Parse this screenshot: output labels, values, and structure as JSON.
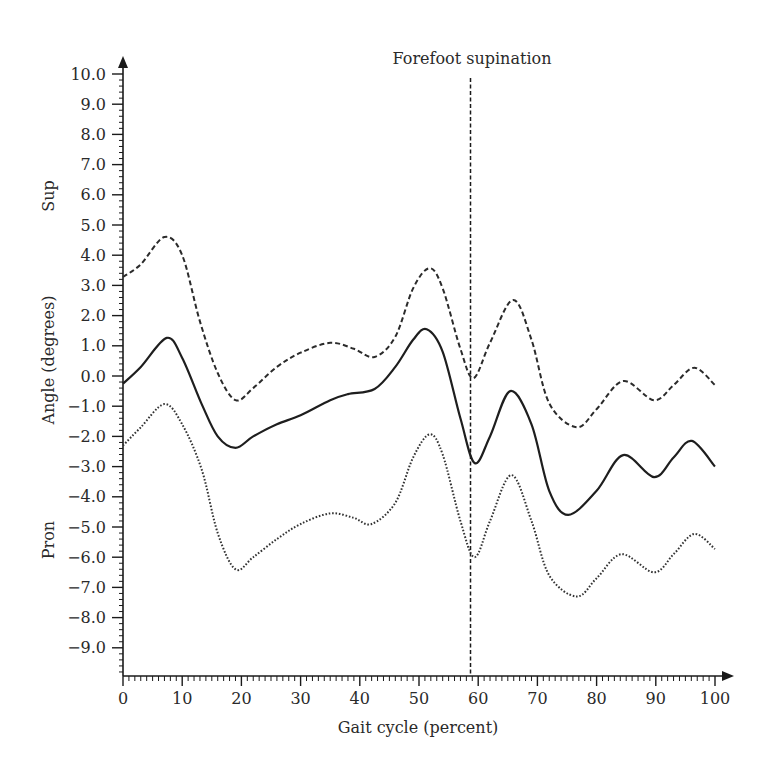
{
  "chart_data": {
    "type": "line",
    "title": "",
    "xlabel": "Gait cycle (percent)",
    "ylabel": "Angle (degrees)",
    "ylabel_top": "Sup",
    "ylabel_bottom": "Pron",
    "xlim": [
      0,
      100
    ],
    "ylim": [
      -10,
      10
    ],
    "grid": false,
    "legend": "none",
    "x_ticks": [
      0,
      10,
      20,
      30,
      40,
      50,
      60,
      70,
      80,
      90,
      100
    ],
    "x_tick_labels": [
      "0",
      "10",
      "20",
      "30",
      "40",
      "50",
      "60",
      "70",
      "80",
      "90",
      "100"
    ],
    "y_ticks": [
      10,
      9,
      8,
      7,
      6,
      5,
      4,
      3,
      2,
      1,
      0,
      -1,
      -2,
      -3,
      -4,
      -5,
      -6,
      -7,
      -8,
      -9
    ],
    "y_tick_labels": [
      "10.0",
      "9.0",
      "8.0",
      "7.0",
      "6.0",
      "5.0",
      "4.0",
      "3.0",
      "2.0",
      "1.0",
      "0.0",
      "−1.0",
      "−2.0",
      "−3.0",
      "−4.0",
      "−5.0",
      "−6.0",
      "−7.0",
      "−8.0",
      "−9.0"
    ],
    "annotations": [
      {
        "type": "vline",
        "x": 58.7,
        "label": "Forefoot supination"
      }
    ],
    "series": [
      {
        "name": "Upper bound",
        "style": "dashed",
        "x": [
          0,
          3,
          7,
          10,
          13,
          16,
          19,
          22,
          26,
          30,
          35,
          39,
          42.5,
          46,
          49,
          51.8,
          54,
          57,
          59.2,
          62,
          65.9,
          69,
          72,
          76.6,
          80,
          84.5,
          89.7,
          93,
          96.5,
          100
        ],
        "values": [
          3.28,
          3.7,
          4.6,
          4.0,
          1.8,
          0.1,
          -0.8,
          -0.4,
          0.3,
          0.77,
          1.1,
          0.9,
          0.63,
          1.3,
          2.9,
          3.57,
          2.9,
          0.9,
          -0.07,
          1.1,
          2.52,
          1.2,
          -0.9,
          -1.7,
          -1.1,
          -0.17,
          -0.8,
          -0.3,
          0.27,
          -0.3
        ]
      },
      {
        "name": "Mean",
        "style": "solid",
        "x": [
          0,
          3,
          7.4,
          10,
          13.3,
          16,
          19,
          22,
          26,
          30,
          35,
          38,
          42.5,
          46,
          49,
          51.3,
          54,
          57,
          59.4,
          62,
          65.4,
          69,
          72,
          75.2,
          80,
          84.5,
          89.7,
          93,
          96.1,
          100
        ],
        "values": [
          -0.25,
          0.3,
          1.26,
          0.6,
          -0.93,
          -2.0,
          -2.38,
          -2.0,
          -1.6,
          -1.3,
          -0.8,
          -0.6,
          -0.43,
          0.3,
          1.2,
          1.55,
          0.8,
          -1.4,
          -2.88,
          -2.0,
          -0.5,
          -1.6,
          -3.8,
          -4.6,
          -3.8,
          -2.62,
          -3.35,
          -2.7,
          -2.15,
          -3.0
        ]
      },
      {
        "name": "Lower bound",
        "style": "dotted",
        "x": [
          0,
          3,
          7,
          10,
          13.3,
          16,
          19,
          22,
          26,
          30,
          35,
          39,
          42,
          46,
          49,
          51.8,
          54,
          57,
          59.4,
          62,
          65.6,
          69,
          72,
          76.6,
          80,
          84.2,
          89.7,
          93,
          96.5,
          100
        ],
        "values": [
          -2.3,
          -1.7,
          -0.93,
          -1.6,
          -3.1,
          -5.2,
          -6.4,
          -6.0,
          -5.4,
          -4.9,
          -4.55,
          -4.7,
          -4.9,
          -4.2,
          -2.7,
          -1.93,
          -2.6,
          -4.8,
          -6.0,
          -4.8,
          -3.28,
          -4.8,
          -6.6,
          -7.3,
          -6.7,
          -5.9,
          -6.5,
          -5.9,
          -5.23,
          -5.73
        ]
      }
    ]
  }
}
